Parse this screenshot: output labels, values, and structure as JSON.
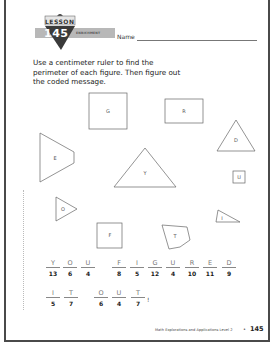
{
  "header": {
    "lesson_label": "LESSON",
    "lesson_number": "145",
    "enrichment_label": "ENRICHMENT",
    "name_label": "Name"
  },
  "instructions": "Use a centimeter ruler to find the perimeter of each figure. Then figure out the coded message.",
  "figures": [
    {
      "label": "G",
      "shape": "square"
    },
    {
      "label": "R",
      "shape": "rectangle"
    },
    {
      "label": "D",
      "shape": "triangle"
    },
    {
      "label": "E",
      "shape": "trapezoid"
    },
    {
      "label": "Y",
      "shape": "triangle"
    },
    {
      "label": "U",
      "shape": "small-square"
    },
    {
      "label": "O",
      "shape": "triangle"
    },
    {
      "label": "I",
      "shape": "triangle"
    },
    {
      "label": "F",
      "shape": "square"
    },
    {
      "label": "T",
      "shape": "pentagon"
    }
  ],
  "coded_message": {
    "row1": [
      {
        "letter": "Y",
        "number": "13"
      },
      {
        "letter": "O",
        "number": "6"
      },
      {
        "letter": "U",
        "number": "4"
      },
      {
        "letter": "F",
        "number": "8"
      },
      {
        "letter": "I",
        "number": "5"
      },
      {
        "letter": "G",
        "number": "12"
      },
      {
        "letter": "U",
        "number": "4"
      },
      {
        "letter": "R",
        "number": "10"
      },
      {
        "letter": "E",
        "number": "11"
      },
      {
        "letter": "D",
        "number": "9"
      }
    ],
    "row2": [
      {
        "letter": "I",
        "number": "5"
      },
      {
        "letter": "T",
        "number": "7"
      },
      {
        "letter": "O",
        "number": "6"
      },
      {
        "letter": "U",
        "number": "4"
      },
      {
        "letter": "T",
        "number": "7"
      }
    ],
    "end_mark": "!"
  },
  "footer": {
    "book_title": "Math Explorations and Applications  Level 2",
    "separator": "•",
    "page_number": "145"
  },
  "colors": {
    "badge_gray": "#b8b8b8",
    "badge_dark": "#3a3a3a",
    "frame": "#4a4a4a"
  }
}
